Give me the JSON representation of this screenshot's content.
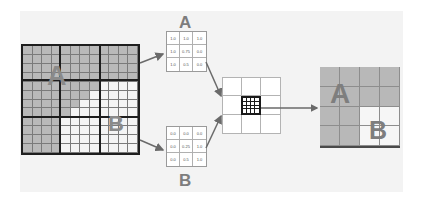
{
  "diagram": {
    "background_panel_color": "#f3f3f3",
    "gray_color": "#b9b9b9",
    "white_color": "#f4f4f4",
    "left_grid": {
      "label_a": "A",
      "label_b": "B",
      "coarse_cells": "3x3",
      "fine_cells_per_coarse": "4x4",
      "mask_rows": [
        "gggggggggggg",
        "gggggggggggg",
        "gggggggggggg",
        "gggggggggggg",
        "ggggggggwwww",
        "gggggggwwwww",
        "ggggggwwwwww",
        "gggggwwwwwww",
        "ggggwwwwwwww",
        "ggggwwwwwwww",
        "ggggwwwwwwww",
        "ggggwwwwwwww"
      ]
    },
    "matrix_a": {
      "label": "A",
      "values": [
        [
          "1.0",
          "1.0",
          "1.0"
        ],
        [
          "1.0",
          "0.75",
          "0.0"
        ],
        [
          "1.0",
          "0.5",
          "0.0"
        ]
      ]
    },
    "matrix_b": {
      "label": "B",
      "values": [
        [
          "0.0",
          "0.0",
          "0.0"
        ],
        [
          "0.0",
          "0.25",
          "1.0"
        ],
        [
          "0.0",
          "0.5",
          "1.0"
        ]
      ]
    },
    "center_grid": {
      "coarse_cells": "3x3",
      "highlighted_cell_fine": "4x4"
    },
    "right_grid": {
      "label_a": "A",
      "label_b": "B",
      "mask_rows": [
        "gggg",
        "gggg",
        "ggww",
        "ggww"
      ]
    }
  }
}
